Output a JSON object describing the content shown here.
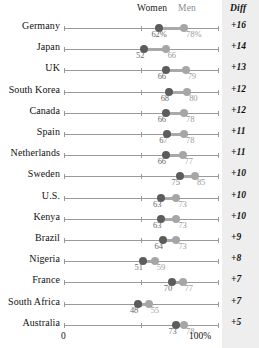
{
  "chart_data": {
    "type": "dot",
    "title": "",
    "xlabel": "",
    "ylabel": "",
    "xlim": [
      0,
      100
    ],
    "x_tick_labels": [
      "0",
      "100%"
    ],
    "grid": false,
    "legend_position": "top",
    "series": [
      {
        "name": "Women",
        "color": "#5c5c5c"
      },
      {
        "name": "Men",
        "color": "#a6a6a6"
      }
    ],
    "categories": [
      "Germany",
      "Japan",
      "UK",
      "South Korea",
      "Canada",
      "Spain",
      "Netherlands",
      "Sweden",
      "U.S.",
      "Kenya",
      "Brazil",
      "Nigeria",
      "France",
      "South Africa",
      "Australia"
    ],
    "rows": [
      {
        "country": "Germany",
        "women": 62,
        "men": 78,
        "women_label": "62%",
        "men_label": "78%",
        "diff": "+16"
      },
      {
        "country": "Japan",
        "women": 52,
        "men": 66,
        "women_label": "52",
        "men_label": "66",
        "diff": "+14"
      },
      {
        "country": "UK",
        "women": 66,
        "men": 79,
        "women_label": "66",
        "men_label": "79",
        "diff": "+13"
      },
      {
        "country": "South Korea",
        "women": 68,
        "men": 80,
        "women_label": "68",
        "men_label": "80",
        "diff": "+12"
      },
      {
        "country": "Canada",
        "women": 66,
        "men": 78,
        "women_label": "66",
        "men_label": "78",
        "diff": "+12"
      },
      {
        "country": "Spain",
        "women": 67,
        "men": 78,
        "women_label": "67",
        "men_label": "78",
        "diff": "+11"
      },
      {
        "country": "Netherlands",
        "women": 66,
        "men": 77,
        "women_label": "66",
        "men_label": "77",
        "diff": "+11"
      },
      {
        "country": "Sweden",
        "women": 75,
        "men": 85,
        "women_label": "75",
        "men_label": "85",
        "diff": "+10"
      },
      {
        "country": "U.S.",
        "women": 63,
        "men": 73,
        "women_label": "63",
        "men_label": "73",
        "diff": "+10"
      },
      {
        "country": "Kenya",
        "women": 63,
        "men": 73,
        "women_label": "63",
        "men_label": "73",
        "diff": "+10"
      },
      {
        "country": "Brazil",
        "women": 64,
        "men": 73,
        "women_label": "64",
        "men_label": "73",
        "diff": "+9"
      },
      {
        "country": "Nigeria",
        "women": 51,
        "men": 59,
        "women_label": "51",
        "men_label": "59",
        "diff": "+8"
      },
      {
        "country": "France",
        "women": 70,
        "men": 77,
        "women_label": "70",
        "men_label": "77",
        "diff": "+7"
      },
      {
        "country": "South Africa",
        "women": 48,
        "men": 55,
        "women_label": "48",
        "men_label": "55",
        "diff": "+7"
      },
      {
        "country": "Australia",
        "women": 73,
        "men": 78,
        "women_label": "73",
        "men_label": "78",
        "diff": "+5"
      }
    ]
  },
  "header": {
    "women": "Women",
    "men": "Men",
    "diff": "Diff"
  },
  "axis": {
    "min_label": "0",
    "max_label": "100%"
  }
}
